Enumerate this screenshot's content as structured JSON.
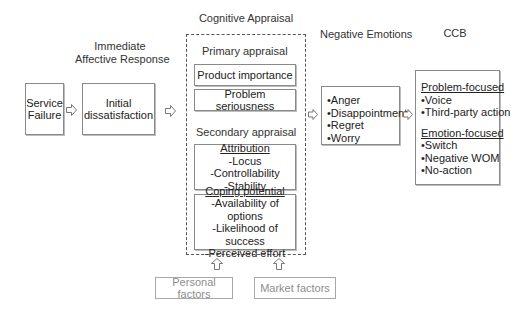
{
  "stages": {
    "immediate_title": [
      "Immediate",
      "Affective Response"
    ],
    "cognitive_title": "Cognitive Appraisal",
    "emotions_title": "Negative Emotions",
    "ccb_title": "CCB"
  },
  "service_failure": [
    "Service",
    "Failure"
  ],
  "initial_dissatisfaction": [
    "Initial",
    "dissatisfaction"
  ],
  "cognitive": {
    "primary_label": "Primary appraisal",
    "primary_items": [
      "Product importance",
      "Problem seriousness"
    ],
    "secondary_label": "Secondary appraisal",
    "attribution": {
      "heading": "Attribution",
      "items": [
        "-Locus",
        "-Controllability",
        "-Stability"
      ]
    },
    "coping": {
      "heading": "Coping potential",
      "items": [
        "-Availability of options",
        "-Likelihood of success",
        "-Perceived effort"
      ]
    }
  },
  "factors": [
    "Personal factors",
    "Market factors"
  ],
  "emotions": [
    "•Anger",
    "•Disappointment",
    "•Regret",
    "•Worry"
  ],
  "ccb": {
    "problem_heading": "Problem-focused",
    "problem_items": [
      "•Voice",
      "•Third-party action"
    ],
    "emotion_heading": "Emotion-focused",
    "emotion_items": [
      "•Switch",
      "•Negative WOM",
      "•No-action"
    ]
  },
  "icons": {
    "right_arrow": "hollow-right-arrow",
    "up_arrow": "hollow-up-arrow"
  },
  "colors": {
    "border": "#8a8a8a",
    "faded_border": "#a8a8a8",
    "faded_text": "#8e8e8e",
    "text": "#222222"
  }
}
